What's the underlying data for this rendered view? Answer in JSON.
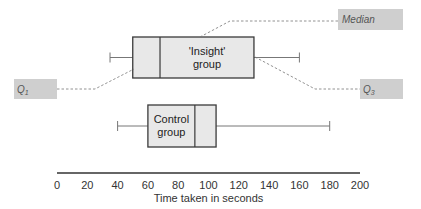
{
  "chart_data": {
    "type": "boxplot",
    "title": "",
    "xlabel": "Time taken in seconds",
    "ylabel": "",
    "xlim": [
      0,
      200
    ],
    "x_ticks": [
      0,
      20,
      40,
      60,
      80,
      100,
      120,
      140,
      160,
      180,
      200
    ],
    "grid": false,
    "series": [
      {
        "name": "'Insight' group",
        "label_lines": [
          "'Insight'",
          "group"
        ],
        "min": 35,
        "q1": 50,
        "median": 68,
        "q3": 130,
        "max": 160
      },
      {
        "name": "Control group",
        "label_lines": [
          "Control",
          "group"
        ],
        "min": 40,
        "q1": 60,
        "median": 91,
        "q3": 105,
        "max": 180
      }
    ],
    "annotations": [
      {
        "text": "Median",
        "target": "'Insight' group median"
      },
      {
        "text": "Q1",
        "target": "'Insight' group lower quartile"
      },
      {
        "text": "Q3",
        "target": "'Insight' group upper quartile"
      }
    ]
  },
  "labels": {
    "median": "Median",
    "q1": "Q",
    "q1_sub": "1",
    "q3": "Q",
    "q3_sub": "3"
  }
}
